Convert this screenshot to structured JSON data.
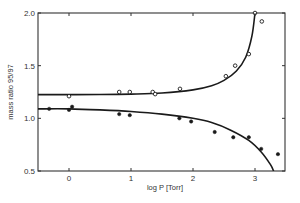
{
  "chart_data": {
    "type": "scatter",
    "title": "",
    "xlabel": "log P  [Torr]",
    "ylabel": "mass ratio 95/97",
    "xlim": [
      -0.5,
      3.55
    ],
    "ylim": [
      0.5,
      2.0
    ],
    "grid": false,
    "legend": null,
    "x_ticks": [
      0,
      1,
      2,
      3
    ],
    "x_tick_labels": [
      "0",
      "1",
      "2",
      "3"
    ],
    "y_ticks": [
      0.5,
      1.0,
      1.5,
      2.0
    ],
    "y_tick_labels": [
      "0.5",
      "1.0",
      "1.5",
      "2.0"
    ],
    "series": [
      {
        "name": "upper (open circles)",
        "marker": "open-circle",
        "x": [
          0.0,
          0.81,
          0.98,
          1.35,
          1.39,
          1.79,
          2.53,
          2.68,
          2.9,
          3.0,
          3.11
        ],
        "y": [
          1.21,
          1.25,
          1.25,
          1.25,
          1.23,
          1.28,
          1.4,
          1.5,
          1.61,
          2.0,
          1.92
        ]
      },
      {
        "name": "lower (filled circles)",
        "marker": "filled-circle",
        "x": [
          -0.32,
          0.0,
          0.05,
          0.81,
          0.98,
          1.78,
          1.97,
          2.35,
          2.65,
          2.9,
          3.1,
          3.37
        ],
        "y": [
          1.09,
          1.08,
          1.11,
          1.04,
          1.03,
          1.0,
          0.97,
          0.87,
          0.82,
          0.82,
          0.71,
          0.66
        ]
      }
    ],
    "fit_curves": [
      {
        "name": "upper fit",
        "x": [
          -0.5,
          0.0,
          0.5,
          1.0,
          1.5,
          2.0,
          2.3,
          2.5,
          2.7,
          2.85,
          2.95,
          3.0
        ],
        "y": [
          1.225,
          1.225,
          1.226,
          1.23,
          1.24,
          1.27,
          1.31,
          1.36,
          1.45,
          1.58,
          1.78,
          2.0
        ]
      },
      {
        "name": "lower fit",
        "x": [
          -0.5,
          0.0,
          0.5,
          1.0,
          1.5,
          2.0,
          2.3,
          2.6,
          2.9,
          3.1,
          3.25,
          3.3
        ],
        "y": [
          1.09,
          1.09,
          1.08,
          1.065,
          1.04,
          1.0,
          0.96,
          0.89,
          0.79,
          0.68,
          0.56,
          0.5
        ]
      }
    ]
  }
}
